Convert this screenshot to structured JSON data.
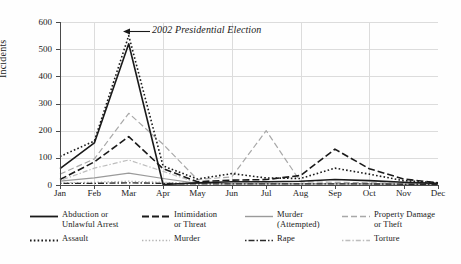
{
  "chart_data": {
    "type": "line",
    "title": "",
    "xlabel": "",
    "ylabel": "Incidents",
    "categories": [
      "Jan",
      "Feb",
      "Mar",
      "Apr",
      "May",
      "Jun",
      "Jul",
      "Aug",
      "Sep",
      "Oct",
      "Nov",
      "Dec"
    ],
    "ylim": [
      0,
      600
    ],
    "yticks": [
      0,
      100,
      200,
      300,
      400,
      500,
      600
    ],
    "grid": true,
    "legend_position": "below",
    "annotations": [
      {
        "text": "2002 Presidential Election",
        "points_to": "Mar",
        "style": "italic-with-arrow"
      }
    ],
    "series": [
      {
        "name": "Abduction or Unlawful Arrest",
        "style": "solid",
        "color": "#1a1a1a",
        "values": [
          60,
          155,
          520,
          2,
          8,
          12,
          12,
          14,
          20,
          16,
          10,
          6
        ]
      },
      {
        "name": "Intimidation or Threat",
        "style": "dashed",
        "color": "#1a1a1a",
        "values": [
          20,
          85,
          178,
          60,
          12,
          18,
          20,
          35,
          132,
          60,
          22,
          8
        ]
      },
      {
        "name": "Murder (Attempted)",
        "style": "solid-gray",
        "color": "#9a9a9a",
        "values": [
          14,
          26,
          44,
          24,
          6,
          4,
          4,
          4,
          4,
          4,
          3,
          3
        ]
      },
      {
        "name": "Property Damage or Theft",
        "style": "dashed-gray",
        "color": "#a8a8a8",
        "values": [
          40,
          96,
          264,
          150,
          20,
          30,
          200,
          12,
          10,
          8,
          6,
          4
        ]
      },
      {
        "name": "Assault",
        "style": "dotted",
        "color": "#1a1a1a",
        "values": [
          105,
          162,
          550,
          70,
          22,
          42,
          26,
          24,
          62,
          40,
          16,
          8
        ]
      },
      {
        "name": "Murder",
        "style": "dotted-gray",
        "color": "#b4b4b4",
        "values": [
          8,
          10,
          14,
          10,
          5,
          4,
          4,
          4,
          5,
          4,
          3,
          3
        ]
      },
      {
        "name": "Rape",
        "style": "dash-dot",
        "color": "#2a2a2a",
        "values": [
          6,
          6,
          8,
          6,
          4,
          4,
          4,
          4,
          4,
          4,
          3,
          3
        ]
      },
      {
        "name": "Torture",
        "style": "dash-dot-gray",
        "color": "#bdbdbd",
        "values": [
          16,
          62,
          92,
          50,
          8,
          6,
          6,
          5,
          5,
          4,
          3,
          3
        ]
      }
    ]
  },
  "axis": {
    "y_label": "Incidents",
    "y_ticks": [
      "0",
      "100",
      "200",
      "300",
      "400",
      "500",
      "600"
    ],
    "x_ticks": [
      "Jan",
      "Feb",
      "Mar",
      "Apr",
      "May",
      "Jun",
      "Jul",
      "Aug",
      "Sep",
      "Oct",
      "Nov",
      "Dec"
    ]
  },
  "annotation": {
    "label": "2002 Presidential Election"
  },
  "legend": {
    "entries": [
      {
        "label": "Abduction or\nUnlawful Arrest",
        "line1": "Abduction or",
        "line2": "Unlawful Arrest",
        "style": "solid"
      },
      {
        "label": "Intimidation\nor Threat",
        "line1": "Intimidation",
        "line2": "or Threat",
        "style": "dashed"
      },
      {
        "label": "Murder\n(Attempted)",
        "line1": "Murder",
        "line2": "(Attempted)",
        "style": "solid-gray"
      },
      {
        "label": "Property Damage\nor Theft",
        "line1": "Property Damage",
        "line2": "or Theft",
        "style": "dashed-gray"
      },
      {
        "label": "Assault",
        "line1": "Assault",
        "line2": "",
        "style": "dotted"
      },
      {
        "label": "Murder",
        "line1": "Murder",
        "line2": "",
        "style": "dotted-gray"
      },
      {
        "label": "Rape",
        "line1": "Rape",
        "line2": "",
        "style": "dash-dot"
      },
      {
        "label": "Torture",
        "line1": "Torture",
        "line2": "",
        "style": "dash-dot-gray"
      }
    ]
  },
  "colors": {
    "axis": "#4a4a4a",
    "grid": "#dcdcdc",
    "dark": "#1a1a1a",
    "gray": "#a8a8a8",
    "background": "#fefefe"
  }
}
